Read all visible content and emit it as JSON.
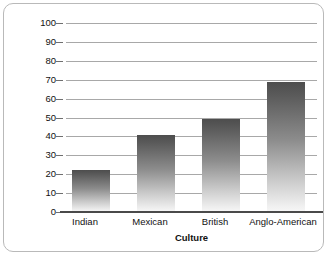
{
  "chart_data": {
    "type": "bar",
    "title": "",
    "categories": [
      "Indian",
      "Mexican",
      "British",
      "Anglo-American"
    ],
    "values": [
      22,
      41,
      49,
      69
    ],
    "xlabel": "Culture",
    "ylabel": "Percentage of Families with High EE",
    "ylim": [
      0,
      100
    ],
    "yticks": [
      0,
      10,
      20,
      30,
      40,
      50,
      60,
      70,
      80,
      90,
      100
    ],
    "ytick_labels": [
      "0",
      "10",
      "20",
      "30",
      "40",
      "50",
      "60",
      "70",
      "80",
      "90",
      "100"
    ],
    "grid": true,
    "legend": false,
    "bar_style": "vertical-gradient-dark-to-light",
    "colors": {
      "bar_top": "#4d4d4d",
      "bar_bottom": "#f7f7f7",
      "gridline": "#a8a8a8",
      "baseline": "#4a4a4a",
      "frame": "#b9b9b9",
      "text": "#111111",
      "background": "#ffffff"
    }
  }
}
